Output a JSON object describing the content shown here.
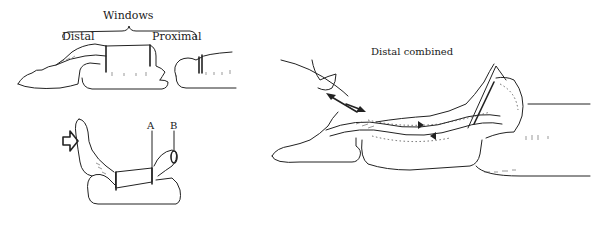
{
  "figure": {
    "panels": [
      {
        "id": "windows",
        "title": "Windows",
        "labels": {
          "left": "Distal",
          "right": "Proximal"
        }
      },
      {
        "id": "lateral",
        "labels": {
          "a": "A",
          "b": "B"
        },
        "icons": [
          "arrow-right-outline-icon"
        ]
      },
      {
        "id": "distal-combined",
        "title": "Distal combined"
      }
    ],
    "colors": {
      "ink": "#222222",
      "background": "#ffffff"
    }
  }
}
